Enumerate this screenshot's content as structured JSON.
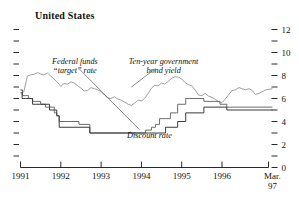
{
  "chart_data": {
    "type": "line",
    "title": "United States",
    "xlabel": "",
    "ylabel": "",
    "ylim": [
      0,
      12
    ],
    "xlim": [
      1991.0,
      1997.25
    ],
    "grid": false,
    "y_axis_position": "right",
    "yticks_major": [
      0,
      2,
      4,
      6,
      8,
      10,
      12
    ],
    "yticks_minor": [
      1,
      3,
      5,
      7,
      9,
      11
    ],
    "xtick_labels": [
      "1991",
      "1992",
      "1993",
      "1994",
      "1995",
      "1996",
      "Mar. 97"
    ],
    "xtick_values": [
      1991,
      1992,
      1993,
      1994,
      1995,
      1996,
      1997.25
    ],
    "legend_position": "annotations-inline",
    "annotations": [
      {
        "name": "fed-funds-label",
        "text_line1": "Federal funds",
        "text_line2": "“target” rate",
        "x": 1992.35,
        "y": 9.0
      },
      {
        "name": "bond-yield-label",
        "text_line1": "Ten-year government",
        "text_line2": "bond yield",
        "x": 1994.55,
        "y": 9.0
      },
      {
        "name": "discount-rate-label",
        "text_line1": "Discount rate",
        "text_line2": "",
        "x": 1994.2,
        "y": 2.55
      }
    ],
    "series": [
      {
        "name": "Ten-year government bond yield",
        "style": "smooth",
        "color": "#8c8c8c",
        "x": [
          1991.0,
          1991.08,
          1991.17,
          1991.25,
          1991.33,
          1991.42,
          1991.5,
          1991.58,
          1991.67,
          1991.75,
          1991.83,
          1991.92,
          1992.0,
          1992.08,
          1992.17,
          1992.25,
          1992.33,
          1992.42,
          1992.5,
          1992.58,
          1992.67,
          1992.75,
          1992.83,
          1992.92,
          1993.0,
          1993.08,
          1993.17,
          1993.25,
          1993.33,
          1993.42,
          1993.5,
          1993.58,
          1993.67,
          1993.75,
          1993.83,
          1993.92,
          1994.0,
          1994.08,
          1994.17,
          1994.25,
          1994.33,
          1994.42,
          1994.5,
          1994.58,
          1994.67,
          1994.75,
          1994.83,
          1994.92,
          1995.0,
          1995.08,
          1995.17,
          1995.25,
          1995.33,
          1995.42,
          1995.5,
          1995.58,
          1995.67,
          1995.75,
          1995.83,
          1995.92,
          1996.0,
          1996.08,
          1996.17,
          1996.25,
          1996.33,
          1996.42,
          1996.5,
          1996.58,
          1996.67,
          1996.75,
          1996.83,
          1996.92,
          1997.0,
          1997.08,
          1997.25
        ],
        "y": [
          6.75,
          6.55,
          7.95,
          8.05,
          8.1,
          8.25,
          8.15,
          8.05,
          8.2,
          7.95,
          7.7,
          7.4,
          7.05,
          7.3,
          7.25,
          7.45,
          7.35,
          7.1,
          6.9,
          6.65,
          6.7,
          6.95,
          6.85,
          6.75,
          6.6,
          6.3,
          6.05,
          6.0,
          6.15,
          5.95,
          5.85,
          5.7,
          5.5,
          5.4,
          5.6,
          5.85,
          5.8,
          6.0,
          6.45,
          6.9,
          7.15,
          7.1,
          7.35,
          7.25,
          7.5,
          7.75,
          7.9,
          7.85,
          7.7,
          7.4,
          7.2,
          7.1,
          6.75,
          6.3,
          6.25,
          6.45,
          6.2,
          6.1,
          5.95,
          5.7,
          5.65,
          5.95,
          6.35,
          6.7,
          6.75,
          6.95,
          6.85,
          6.75,
          6.85,
          6.7,
          6.35,
          6.45,
          6.6,
          6.75,
          6.85
        ]
      },
      {
        "name": "Federal funds “target” rate",
        "style": "step",
        "color": "#6e6e6e",
        "x": [
          1991.0,
          1991.05,
          1991.12,
          1991.2,
          1991.3,
          1991.38,
          1991.5,
          1991.62,
          1991.72,
          1991.84,
          1991.9,
          1991.96,
          1992.2,
          1992.45,
          1992.72,
          1993.72,
          1994.1,
          1994.25,
          1994.35,
          1994.45,
          1994.6,
          1994.72,
          1994.9,
          1995.1,
          1995.55,
          1995.95,
          1996.12,
          1997.25
        ],
        "y": [
          6.75,
          6.25,
          6.25,
          6.0,
          5.75,
          5.75,
          5.5,
          5.25,
          5.25,
          4.75,
          4.5,
          4.0,
          4.0,
          3.75,
          3.0,
          3.0,
          3.25,
          3.5,
          3.75,
          4.25,
          4.25,
          4.75,
          5.5,
          6.0,
          5.75,
          5.5,
          5.25,
          5.25
        ]
      },
      {
        "name": "Discount rate",
        "style": "step",
        "color": "#3a3a3a",
        "x": [
          1991.0,
          1991.04,
          1991.12,
          1991.3,
          1991.5,
          1991.72,
          1991.9,
          1991.96,
          1992.45,
          1992.72,
          1993.72,
          1994.35,
          1994.6,
          1994.9,
          1995.1,
          1995.55,
          1996.12,
          1997.25
        ],
        "y": [
          6.5,
          6.0,
          6.0,
          5.5,
          5.5,
          5.0,
          4.5,
          3.5,
          3.5,
          3.0,
          3.0,
          3.0,
          3.5,
          4.0,
          4.75,
          5.25,
          5.0,
          5.0
        ]
      }
    ]
  },
  "axes": {
    "left_axis_name": "left-axis-ticks",
    "right_axis_name": "right-axis-labels",
    "baseline_name": "x-axis-baseline"
  }
}
